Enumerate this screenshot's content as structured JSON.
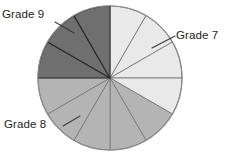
{
  "chart_data": {
    "type": "pie",
    "title": "",
    "subtitle": "",
    "xlabel": "",
    "ylabel": "",
    "grid": false,
    "legend_position": "callout-labels",
    "total_segments": 12,
    "segment_angle_degrees": 30,
    "categories": [
      "Grade 7",
      "Grade 8",
      "Grade 9"
    ],
    "values": [
      4,
      5,
      3
    ],
    "fractions": [
      "4/12",
      "5/12",
      "3/12"
    ],
    "percentages": [
      33.3,
      41.7,
      25.0
    ],
    "colors": [
      "#e9e9e9",
      "#b4b4b4",
      "#6f6f6f"
    ],
    "series": [
      {
        "name": "Students by grade",
        "values": [
          4,
          5,
          3
        ]
      }
    ],
    "segments": [
      {
        "index": 1,
        "category": "Grade 7",
        "start_deg": 0,
        "end_deg": 30,
        "color": "#e9e9e9"
      },
      {
        "index": 2,
        "category": "Grade 7",
        "start_deg": 30,
        "end_deg": 60,
        "color": "#e9e9e9"
      },
      {
        "index": 3,
        "category": "Grade 7",
        "start_deg": 60,
        "end_deg": 90,
        "color": "#e9e9e9"
      },
      {
        "index": 4,
        "category": "Grade 7",
        "start_deg": 90,
        "end_deg": 120,
        "color": "#e9e9e9"
      },
      {
        "index": 5,
        "category": "Grade 8",
        "start_deg": 120,
        "end_deg": 150,
        "color": "#b4b4b4"
      },
      {
        "index": 6,
        "category": "Grade 8",
        "start_deg": 150,
        "end_deg": 180,
        "color": "#b4b4b4"
      },
      {
        "index": 7,
        "category": "Grade 8",
        "start_deg": 180,
        "end_deg": 210,
        "color": "#b4b4b4"
      },
      {
        "index": 8,
        "category": "Grade 8",
        "start_deg": 210,
        "end_deg": 240,
        "color": "#b4b4b4"
      },
      {
        "index": 9,
        "category": "Grade 8",
        "start_deg": 240,
        "end_deg": 270,
        "color": "#b4b4b4"
      },
      {
        "index": 10,
        "category": "Grade 9",
        "start_deg": 270,
        "end_deg": 300,
        "color": "#6f6f6f"
      },
      {
        "index": 11,
        "category": "Grade 9",
        "start_deg": 300,
        "end_deg": 330,
        "color": "#6f6f6f"
      },
      {
        "index": 12,
        "category": "Grade 9",
        "start_deg": 330,
        "end_deg": 360,
        "color": "#6f6f6f"
      }
    ]
  },
  "labels": {
    "grade7": "Grade 7",
    "grade8": "Grade 8",
    "grade9": "Grade 9"
  }
}
